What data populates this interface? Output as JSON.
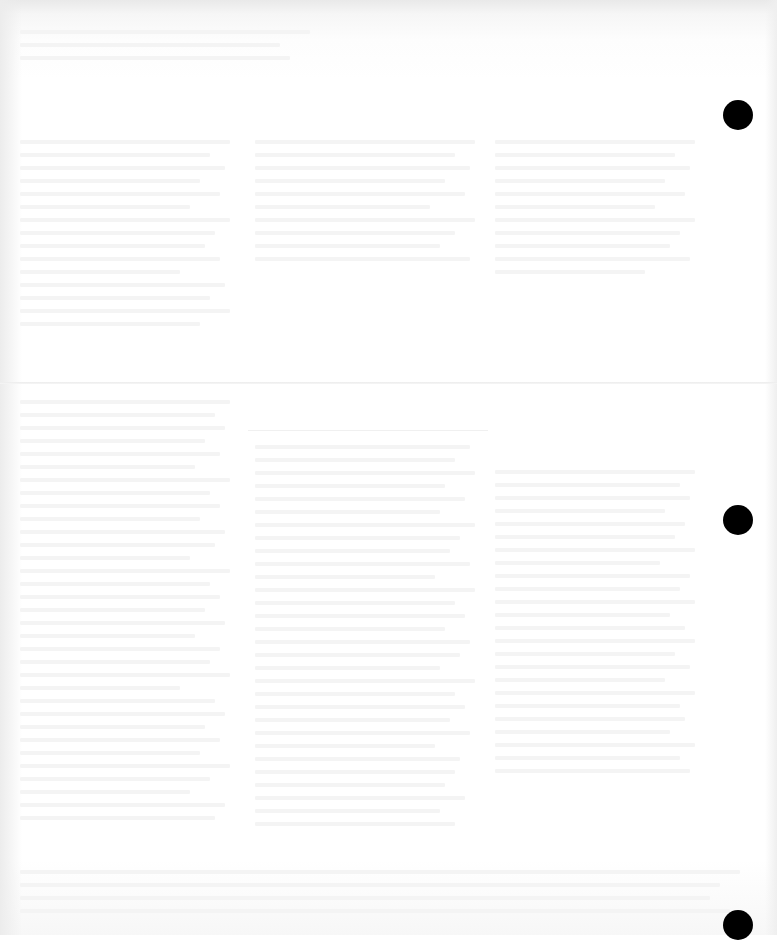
{
  "document": {
    "type": "scanned-page",
    "background_color": "#ffffff",
    "text_legible": false,
    "text_note": "",
    "columns": 3,
    "fold_line_y": 383
  },
  "punch_holes": [
    {
      "x": 738,
      "y": 115,
      "color": "#000000"
    },
    {
      "x": 738,
      "y": 520,
      "color": "#000000"
    },
    {
      "x": 738,
      "y": 925,
      "color": "#000000"
    }
  ]
}
